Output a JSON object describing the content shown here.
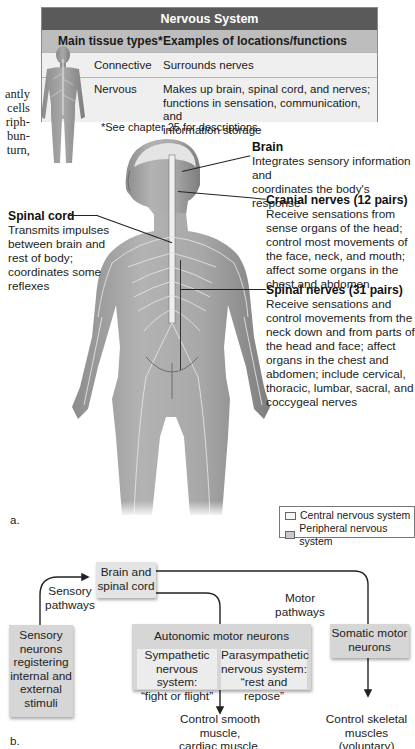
{
  "book_margin_text": [
    "antly",
    "cells",
    "riph-",
    "bun-",
    "turn,"
  ],
  "table": {
    "title": "Nervous System",
    "headers": [
      "Main tissue types*",
      "Examples of locations/functions"
    ],
    "rows": [
      {
        "tissue": "Connective",
        "function": "Surrounds nerves"
      },
      {
        "tissue": "Nervous",
        "function_lines": [
          "Makes up brain, spinal cord, and nerves;",
          "functions in sensation, communication, and",
          "information storage"
        ]
      }
    ],
    "footnote": "*See chapter 25 for descriptions."
  },
  "figure_a": {
    "panel_label": "a.",
    "labels": {
      "brain": {
        "title": "Brain",
        "lines": [
          "Integrates sensory information and",
          "coordinates the body's response"
        ]
      },
      "cranial": {
        "title": "Cranial nerves (12 pairs)",
        "lines": [
          "Receive sensations from",
          "sense organs of the head;",
          "control most movements of",
          "the face, neck, and mouth;",
          "affect some organs in the",
          "chest and abdomen"
        ]
      },
      "spinal_cord": {
        "title": "Spinal cord",
        "lines": [
          "Transmits impulses",
          "between brain and",
          "rest of body;",
          "coordinates some",
          "reflexes"
        ]
      },
      "spinal_nerves": {
        "title": "Spinal nerves (31 pairs)",
        "lines": [
          "Receive sensations and",
          "control movements from the",
          "neck down and from parts of",
          "the head and face; affect",
          "organs in the chest and",
          "abdomen; include cervical,",
          "thoracic, lumbar, sacral, and",
          "coccygeal nerves"
        ]
      }
    },
    "legend": [
      {
        "label": "Central nervous system",
        "color": "#f4f4f4"
      },
      {
        "label": "Peripheral nervous system",
        "color": "#c8c8c8"
      }
    ]
  },
  "figure_b": {
    "panel_label": "b.",
    "brain_box": [
      "Brain and",
      "spinal cord"
    ],
    "sensory_pathways": [
      "Sensory",
      "pathways"
    ],
    "motor_pathways": [
      "Motor",
      "pathways"
    ],
    "sensory_box": [
      "Sensory",
      "neurons",
      "registering",
      "internal and",
      "external",
      "stimuli"
    ],
    "autonomic_box": {
      "title": "Autonomic motor neurons",
      "sympathetic": [
        "Sympathetic",
        "nervous system:",
        "“fight or flight”"
      ],
      "parasympathetic": [
        "Parasympathetic",
        "nervous system:",
        "“rest and repose”"
      ]
    },
    "somatic_box": [
      "Somatic motor",
      "neurons"
    ],
    "autonomic_output": [
      "Control smooth muscle,",
      "cardiac muscle,",
      "glands (involuntary)"
    ],
    "somatic_output": [
      "Control skeletal",
      "muscles (voluntary)"
    ]
  },
  "colors": {
    "table_title_bg": "#5a5a5a",
    "table_header_bg": "#bdbdbd",
    "box_bg": "#d6d6d6",
    "inner_box_bg": "#ececec"
  }
}
